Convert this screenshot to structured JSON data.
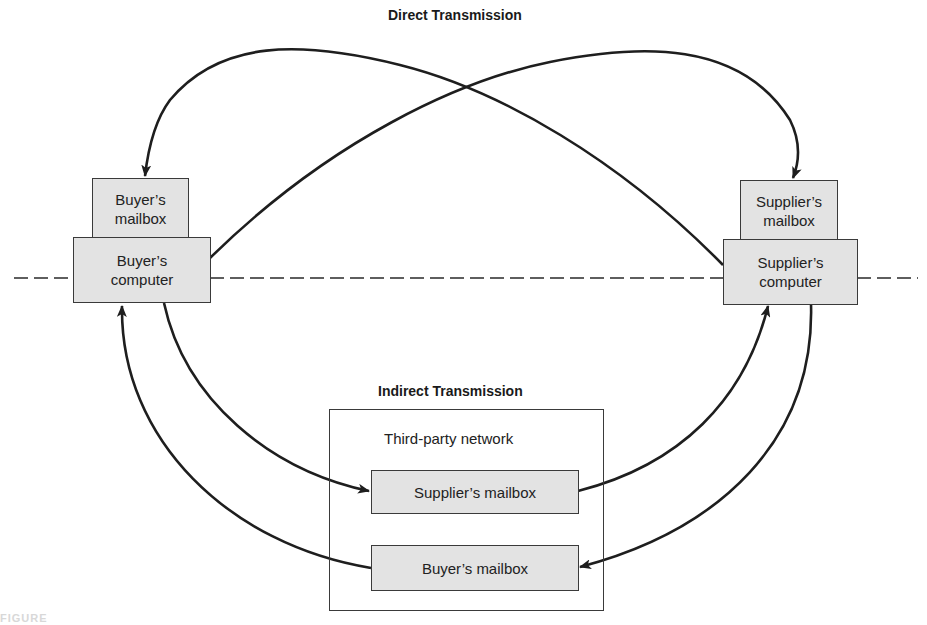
{
  "titles": {
    "direct": "Direct Transmission",
    "indirect": "Indirect Transmission"
  },
  "buyer": {
    "mailbox": "Buyer's\nmailbox",
    "mailbox_line1": "Buyer’s",
    "mailbox_line2": "mailbox",
    "computer_line1": "Buyer’s",
    "computer_line2": "computer"
  },
  "supplier": {
    "mailbox_line1": "Supplier’s",
    "mailbox_line2": "mailbox",
    "computer_line1": "Supplier’s",
    "computer_line2": "computer"
  },
  "network": {
    "label": "Third-party network",
    "supplier_mailbox": "Supplier’s mailbox",
    "buyer_mailbox": "Buyer’s mailbox"
  },
  "caption": "FIGURE",
  "colors": {
    "box_fill": "#e3e3e3",
    "stroke": "#1e1e1e",
    "background": "#ffffff"
  },
  "edges": [
    {
      "from": "buyer-computer",
      "to": "supplier-mailbox",
      "type": "direct"
    },
    {
      "from": "supplier-computer",
      "to": "buyer-mailbox",
      "type": "direct"
    },
    {
      "from": "buyer-computer",
      "to": "network-supplier-mailbox",
      "type": "indirect"
    },
    {
      "from": "network-supplier-mailbox",
      "to": "supplier-computer",
      "type": "indirect"
    },
    {
      "from": "supplier-computer",
      "to": "network-buyer-mailbox",
      "type": "indirect"
    },
    {
      "from": "network-buyer-mailbox",
      "to": "buyer-computer",
      "type": "indirect"
    }
  ]
}
